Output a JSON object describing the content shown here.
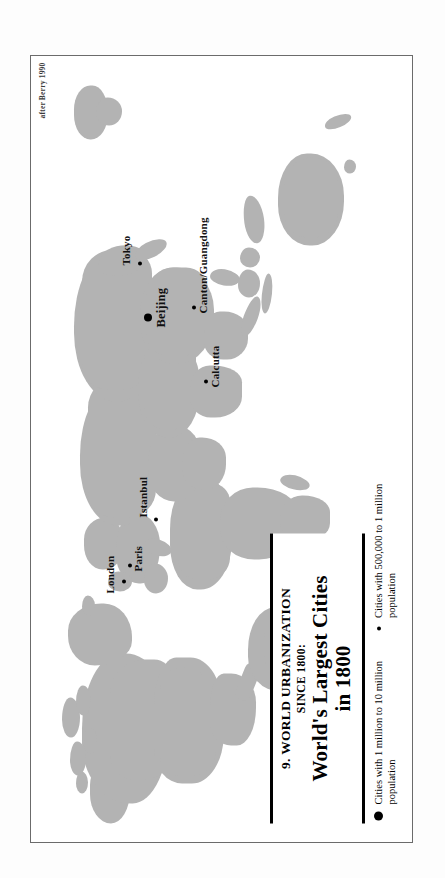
{
  "plate": {
    "attribution": "after Berry 1990"
  },
  "title_block": {
    "number_and_series": "9. WORLD URBANIZATION",
    "subtitle": "SINCE 1800:",
    "main_title_line1": "World's Largest Cities",
    "main_title_line2": "in 1800"
  },
  "legend": {
    "items": [
      {
        "symbol": "large-filled-circle",
        "line1": "Cities with 1 million to 10 million",
        "line2": "population"
      },
      {
        "symbol": "small-filled-circle",
        "line1": "Cities with 500,000 to 1 million",
        "line2": "population"
      }
    ]
  },
  "map": {
    "projection_note": "world map, land shaded grey, printed sideways on the page",
    "land_color": "#b3b3b3",
    "frame_color": "#6b6b6b",
    "background_color": "#ffffff",
    "cities": [
      {
        "name": "London",
        "size": "small"
      },
      {
        "name": "Paris",
        "size": "small"
      },
      {
        "name": "Istanbul",
        "size": "small"
      },
      {
        "name": "Calcutta",
        "size": "small"
      },
      {
        "name": "Beijing",
        "size": "large"
      },
      {
        "name": "Canton/Guangdong",
        "size": "small"
      },
      {
        "name": "Tokyo",
        "size": "small"
      }
    ]
  }
}
